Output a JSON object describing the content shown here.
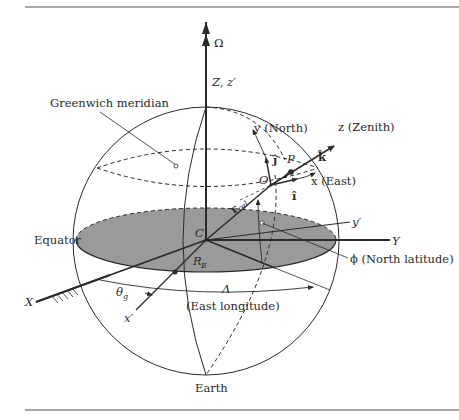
{
  "figure": {
    "colors": {
      "line": "#2a2a2a",
      "equatorial_plane_fill": "#9a9a9a",
      "rule": "#555555",
      "background": "#ffffff"
    },
    "labels": {
      "omega": "Ω",
      "z_axis": "Z, z′",
      "greenwich": "Greenwich meridian",
      "y_north": "y (North)",
      "z_zenith": "z (Zenith)",
      "j_hat": "ĵ",
      "k_hat": "k̂",
      "p_point": "P",
      "o_point": "O",
      "x_east": "x (East)",
      "i_hat": "î",
      "r_rel": "r",
      "r_rel_sub": "rel",
      "equator": "Equator",
      "c_point": "C",
      "y_prime": "y′",
      "y_axis": "Y",
      "phi": "ϕ (North latitude)",
      "r_e": "R",
      "r_e_sub": "E",
      "x_axis": "X",
      "theta_g": "θ",
      "theta_g_sub": "g",
      "lambda": "Λ",
      "east_longitude": "(East longitude)",
      "x_prime": "x′",
      "earth": "Earth"
    }
  }
}
